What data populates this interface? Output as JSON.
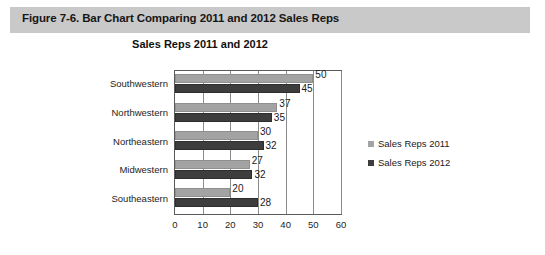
{
  "figure": {
    "caption": "Figure 7-6. Bar Chart Comparing 2011 and 2012 Sales Reps"
  },
  "chart_data": {
    "type": "bar",
    "orientation": "horizontal",
    "title": "Sales Reps 2011 and 2012",
    "xlabel": "",
    "ylabel": "",
    "xlim": [
      0,
      60
    ],
    "xticks": [
      0,
      10,
      20,
      30,
      40,
      50,
      60
    ],
    "grid": true,
    "grid_axis": "x",
    "legend_position": "right",
    "categories": [
      "Southwestern",
      "Northwestern",
      "Northeastern",
      "Midwestern",
      "Southeastern"
    ],
    "series": [
      {
        "name": "Sales Reps 2011",
        "color": "#a3a3a3",
        "values": [
          50,
          37,
          30,
          27,
          20
        ],
        "drawn_values": [
          50,
          37,
          30,
          27,
          20
        ]
      },
      {
        "name": "Sales Reps 2012",
        "color": "#3d3d3d",
        "values": [
          45,
          35,
          32,
          32,
          28
        ],
        "drawn_values": [
          45,
          35,
          32,
          28,
          30
        ]
      }
    ]
  }
}
